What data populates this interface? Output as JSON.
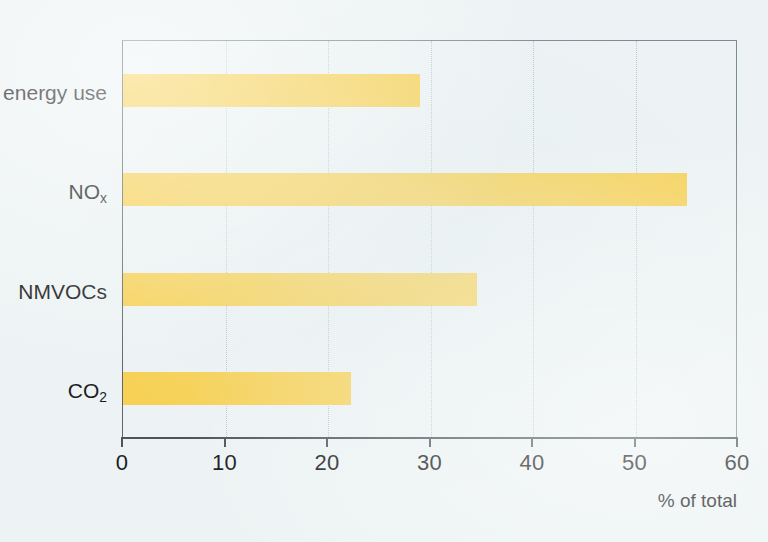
{
  "chart_data": {
    "type": "bar",
    "orientation": "horizontal",
    "title": "",
    "subtitle": "",
    "xlabel": "% of total",
    "ylabel": "",
    "xlim": [
      0,
      60
    ],
    "xticks": [
      0,
      10,
      20,
      30,
      40,
      50,
      60
    ],
    "xtick_labels": [
      "0",
      "10",
      "20",
      "30",
      "40",
      "50",
      "60"
    ],
    "grid": "vertical-dotted",
    "legend": "none",
    "categories": [
      "energy use",
      "NOx",
      "NMVOCs",
      "CO2"
    ],
    "category_labels_html": [
      "energy use",
      "NO<sub>x</sub>",
      "NMVOCs",
      "CO<sub>2</sub>"
    ],
    "values": [
      29,
      55,
      34.5,
      22.2
    ],
    "series": [
      {
        "name": "% of total",
        "values": [
          29,
          55,
          34.5,
          22.2
        ]
      }
    ],
    "bar_color": "#f7d155",
    "background_color": "#edf3f4",
    "axis_color": "#4c5659",
    "frame_color": "#7d8c90",
    "gridline_color": "#b9c8cc"
  },
  "axis": {
    "x_title": "% of total",
    "ticks": [
      {
        "value": "0"
      },
      {
        "value": "10"
      },
      {
        "value": "20"
      },
      {
        "value": "30"
      },
      {
        "value": "40"
      },
      {
        "value": "50"
      },
      {
        "value": "60"
      }
    ]
  },
  "categories": [
    {
      "label": "energy use",
      "sub": ""
    },
    {
      "label": "NO",
      "sub": "x"
    },
    {
      "label": "NMVOCs",
      "sub": ""
    },
    {
      "label": "CO",
      "sub": "2"
    }
  ]
}
